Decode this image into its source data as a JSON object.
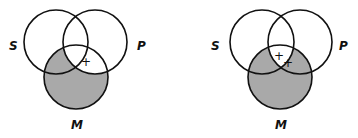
{
  "colors": {
    "shade": "#a9a9a9",
    "stroke": "#111111",
    "background": "#ffffff"
  },
  "diagrams": [
    {
      "labels": {
        "s": "S",
        "p": "P",
        "m": "M"
      },
      "shaded_regions": [
        "S∩M∩¬P",
        "M∩¬S∩¬P"
      ],
      "marks": [
        {
          "symbol": "+",
          "position": "on M boundary within S∩P"
        }
      ]
    },
    {
      "labels": {
        "s": "S",
        "p": "P",
        "m": "M"
      },
      "shaded_regions": [
        "S∩M∩¬P",
        "P∩M∩¬S",
        "M∩¬S∩¬P"
      ],
      "marks": [
        {
          "symbol": "+",
          "position": "S∩P∩M"
        },
        {
          "symbol": "+",
          "position": "on P boundary inside M"
        }
      ]
    }
  ]
}
